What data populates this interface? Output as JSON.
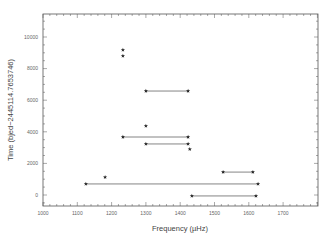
{
  "chart_data": {
    "type": "scatter",
    "title": "",
    "xlabel": "Frequency (µHz)",
    "ylabel": "Time (bjed−2445114.7653746)",
    "xlim": [
      1000,
      1800
    ],
    "ylim": [
      -700,
      11450
    ],
    "xticks": [
      1000,
      1100,
      1200,
      1300,
      1400,
      1500,
      1600,
      1700
    ],
    "xtick_labels": [
      "1000",
      "1100",
      "1200",
      "1300",
      "1400",
      "1500",
      "1600",
      "1700"
    ],
    "yticks": [
      0,
      2000,
      4000,
      6000,
      8000,
      10000
    ],
    "ytick_labels": [
      "0",
      "2000",
      "4000",
      "6000",
      "8000",
      "10000"
    ],
    "grid": false,
    "legend": null,
    "series": [
      {
        "name": "single detections",
        "marker": "star",
        "points": [
          {
            "x": 1233,
            "y": 9180
          },
          {
            "x": 1233,
            "y": 8800
          },
          {
            "x": 1300,
            "y": 4370
          },
          {
            "x": 1428,
            "y": 2900
          },
          {
            "x": 1181,
            "y": 1130
          }
        ]
      },
      {
        "name": "paired detections",
        "marker": "star",
        "segments": [
          {
            "x1": 1300,
            "x2": 1423,
            "y": 6580
          },
          {
            "x1": 1233,
            "x2": 1423,
            "y": 3670
          },
          {
            "x1": 1300,
            "x2": 1423,
            "y": 3230
          },
          {
            "x1": 1525,
            "x2": 1612,
            "y": 1450
          },
          {
            "x1": 1125,
            "x2": 1627,
            "y": 700
          },
          {
            "x1": 1434,
            "x2": 1621,
            "y": -60
          }
        ]
      }
    ]
  },
  "colors": {
    "axis": "#555555",
    "marker": "#222222",
    "line": "#666666",
    "background": "#ffffff"
  },
  "layout": {
    "plot": {
      "left": 43,
      "right": 318,
      "top": 14,
      "bottom": 206
    },
    "x_zero_px": 43,
    "x_scale": 0.343,
    "y_zero_px": 195,
    "y_scale": 0.0158
  }
}
